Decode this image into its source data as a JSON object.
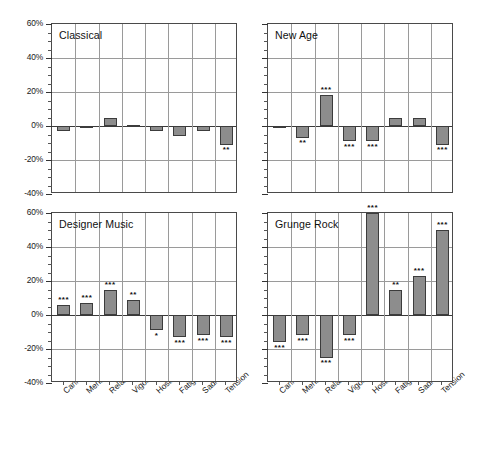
{
  "chart_data": {
    "type": "bar",
    "title": "",
    "xlabel": "",
    "ylabel": "",
    "ylim": [
      -40,
      60
    ],
    "ytick_labels": [
      "60%",
      "40%",
      "20%",
      "0%",
      "-20%",
      "-40%"
    ],
    "ytick_values": [
      60,
      40,
      20,
      0,
      -20,
      -40
    ],
    "grid": true,
    "legend": "none",
    "categories": [
      "Caring",
      "Mental clarity",
      "Relaxation",
      "Vigor",
      "Hostility",
      "Fatigue",
      "Sadness",
      "Tension"
    ],
    "panels": [
      {
        "name": "Classical",
        "values": [
          -3,
          -1,
          5,
          0.5,
          -3,
          -6,
          -3,
          -11
        ],
        "significance": [
          "",
          "",
          "",
          "",
          "",
          "",
          "",
          "**"
        ]
      },
      {
        "name": "New Age",
        "values": [
          -0.5,
          -7,
          18,
          -9,
          -9,
          5,
          5,
          -11
        ],
        "significance": [
          "",
          "**",
          "***",
          "***",
          "***",
          "",
          "",
          "***"
        ]
      },
      {
        "name": "Designer Music",
        "values": [
          6,
          7,
          15,
          9,
          -9,
          -13,
          -12,
          -13
        ],
        "significance": [
          "***",
          "***",
          "***",
          "**",
          "*",
          "***",
          "***",
          "***"
        ]
      },
      {
        "name": "Grunge Rock",
        "values": [
          -16,
          -12,
          -25,
          -12,
          60,
          15,
          23,
          50
        ],
        "significance": [
          "***",
          "***",
          "***",
          "***",
          "***",
          "**",
          "***",
          "***"
        ]
      }
    ]
  },
  "colors": {
    "bar_fill": "#8d8d8d",
    "bar_stroke": "#3c3c3c",
    "grid": "#9a9a9a",
    "axis": "#4a4a4a",
    "text": "#1a1a1a"
  }
}
